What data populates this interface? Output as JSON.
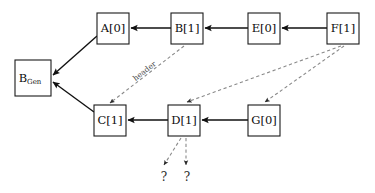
{
  "diagram": {
    "type": "node-link-graph",
    "background_color": "#ffffff",
    "solid_edge_color": "#111111",
    "dashed_edge_color": "#8a8a8a",
    "node_stroke_color": "#1a1a1a",
    "nodes": [
      {
        "id": "bgen",
        "label": "B",
        "subscript": "Gen",
        "x": 15,
        "y": 60,
        "w": 36,
        "h": 36
      },
      {
        "id": "a",
        "label": "A[0]",
        "subscript": "",
        "x": 97,
        "y": 13,
        "w": 32,
        "h": 31
      },
      {
        "id": "b",
        "label": "B[1]",
        "subscript": "",
        "x": 171,
        "y": 13,
        "w": 32,
        "h": 31
      },
      {
        "id": "e",
        "label": "E[0]",
        "subscript": "",
        "x": 248,
        "y": 13,
        "w": 32,
        "h": 31
      },
      {
        "id": "f",
        "label": "F[1]",
        "subscript": "",
        "x": 327,
        "y": 13,
        "w": 32,
        "h": 31
      },
      {
        "id": "c",
        "label": "C[1]",
        "subscript": "",
        "x": 94,
        "y": 105,
        "w": 32,
        "h": 31
      },
      {
        "id": "d",
        "label": "D[1]",
        "subscript": "",
        "x": 168,
        "y": 105,
        "w": 32,
        "h": 31
      },
      {
        "id": "g",
        "label": "G[0]",
        "subscript": "",
        "x": 248,
        "y": 105,
        "w": 32,
        "h": 31
      }
    ],
    "solid_edges": [
      {
        "id": "b-to-a",
        "from": "b",
        "to": "a",
        "points": "171,28 131,28"
      },
      {
        "id": "e-to-b",
        "from": "e",
        "to": "b",
        "points": "248,28 205,28"
      },
      {
        "id": "f-to-e",
        "from": "f",
        "to": "e",
        "points": "327,28 282,28"
      },
      {
        "id": "a-to-bgen",
        "from": "a",
        "to": "bgen",
        "points": "97,36 53,75"
      },
      {
        "id": "c-to-bgen",
        "from": "c",
        "to": "bgen",
        "points": "94,112 53,82"
      },
      {
        "id": "d-to-c",
        "from": "d",
        "to": "c",
        "points": "168,120 128,120"
      },
      {
        "id": "g-to-d",
        "from": "g",
        "to": "d",
        "points": "248,120 202,120"
      }
    ],
    "dashed_edges": [
      {
        "id": "b-to-c-header",
        "from": "b",
        "to": "c",
        "label": "header",
        "points": "184,46 110,103"
      },
      {
        "id": "f-to-d",
        "from": "f",
        "to": "d",
        "label": "",
        "points": "341,46 187,102"
      },
      {
        "id": "f-to-g",
        "from": "f",
        "to": "g",
        "label": "",
        "points": "344,46 265,102"
      },
      {
        "id": "d-to-q1",
        "from": "d",
        "to": "q1",
        "label": "",
        "points": "181,138 164,165"
      },
      {
        "id": "d-to-q2",
        "from": "d",
        "to": "q2",
        "label": "",
        "points": "186,138 186,165"
      }
    ],
    "edge_labels": [
      {
        "id": "header-label",
        "text": "header",
        "x": 146,
        "y": 73,
        "rotation": -38
      }
    ],
    "terminals": [
      {
        "id": "q1",
        "text": "?",
        "x": 164,
        "y": 181
      },
      {
        "id": "q2",
        "text": "?",
        "x": 187,
        "y": 181
      }
    ]
  }
}
